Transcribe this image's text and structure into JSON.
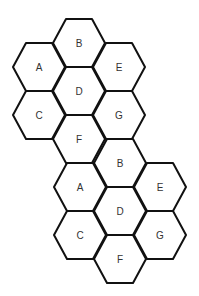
{
  "diagram": {
    "hex_radius": 26,
    "clusters": [
      {
        "name": "cluster-1",
        "cells": [
          {
            "label": "B",
            "cx": 79,
            "cy": 43
          },
          {
            "label": "A",
            "cx": 39,
            "cy": 67
          },
          {
            "label": "E",
            "cx": 119,
            "cy": 67
          },
          {
            "label": "D",
            "cx": 79,
            "cy": 91
          },
          {
            "label": "C",
            "cx": 39,
            "cy": 115
          },
          {
            "label": "G",
            "cx": 119,
            "cy": 115
          },
          {
            "label": "F",
            "cx": 79,
            "cy": 139
          }
        ]
      },
      {
        "name": "cluster-2",
        "cells": [
          {
            "label": "B",
            "cx": 120,
            "cy": 163
          },
          {
            "label": "A",
            "cx": 80,
            "cy": 187
          },
          {
            "label": "E",
            "cx": 160,
            "cy": 187
          },
          {
            "label": "D",
            "cx": 120,
            "cy": 211
          },
          {
            "label": "C",
            "cx": 80,
            "cy": 235
          },
          {
            "label": "G",
            "cx": 160,
            "cy": 235
          },
          {
            "label": "F",
            "cx": 120,
            "cy": 259
          }
        ]
      }
    ]
  }
}
